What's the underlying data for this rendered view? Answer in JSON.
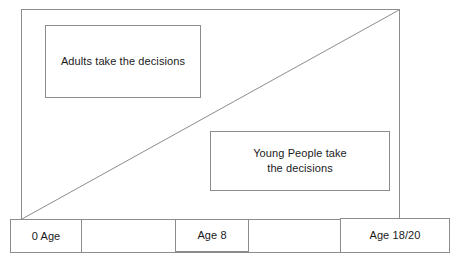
{
  "diagram": {
    "style": {
      "stroke_color": "#8c8c8c",
      "text_color": "#1a1a1a",
      "background_color": "#ffffff"
    },
    "regions": [
      {
        "id": "adults",
        "label": "Adults take the decisions"
      },
      {
        "id": "young_people",
        "label": "Young People take\nthe decisions"
      }
    ],
    "timeline": {
      "markers": [
        {
          "id": "start",
          "label": "0 Age"
        },
        {
          "id": "middle",
          "label": "Age 8"
        },
        {
          "id": "end",
          "label": "Age 18/20"
        }
      ]
    },
    "divider": {
      "name": "diagonal-divider",
      "description": "Diagonal line from bottom-left to top-right separating adult and young-person decision areas",
      "from": {
        "x": 22,
        "y": 219
      },
      "to": {
        "x": 399,
        "y": 10
      }
    }
  }
}
